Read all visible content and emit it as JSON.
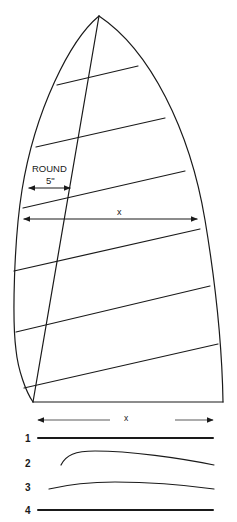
{
  "figure": {
    "labels": {
      "round_title": "ROUND",
      "round_value": "5\"",
      "width_label": "x",
      "foot_width_label": "x"
    },
    "section_numbers": [
      "1",
      "2",
      "3",
      "4"
    ],
    "colors": {
      "ink": "#1a1a1a",
      "paper": "#ffffff"
    }
  }
}
